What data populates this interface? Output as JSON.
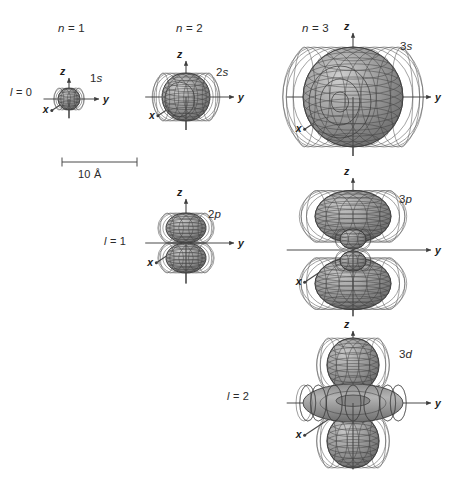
{
  "figure": {
    "background_color": "#ffffff",
    "surface_color": "#9a9a9a",
    "surface_color_dark": "#6f6f6f",
    "surface_color_light": "#c8c8c8",
    "mesh_color": "#3a3a3a",
    "axis_color": "#4a4a4a",
    "text_color": "#2b2b2b"
  },
  "column_headers": [
    {
      "id": "n1",
      "label": "n = 1",
      "italic_part": "n",
      "rest": " = 1",
      "x": 58,
      "y": 22
    },
    {
      "id": "n2",
      "label": "n = 2",
      "italic_part": "n",
      "rest": " = 2",
      "x": 176,
      "y": 22
    },
    {
      "id": "n3",
      "label": "n = 3",
      "italic_part": "n",
      "rest": " = 3",
      "x": 302,
      "y": 22
    }
  ],
  "row_labels": [
    {
      "id": "l0",
      "label": "l = 0",
      "italic_part": "l",
      "rest": " = 0",
      "x": 10,
      "y": 86
    },
    {
      "id": "l1",
      "label": "l = 1",
      "italic_part": "l",
      "rest": " = 1",
      "x": 104,
      "y": 235
    },
    {
      "id": "l2",
      "label": "l = 2",
      "italic_part": "l",
      "rest": " = 2",
      "x": 227,
      "y": 390
    }
  ],
  "orbitals": [
    {
      "id": "1s",
      "name": "1s",
      "n": 1,
      "l": 0,
      "shape": "sphere",
      "label_prefix": "1",
      "label_suffix": "s",
      "label_x": 90,
      "label_y": 72,
      "center_x": 69,
      "center_y": 99,
      "radius": 11,
      "axis_len_z": 21,
      "axis_len_y": 30,
      "axis_len_x": 22
    },
    {
      "id": "2s",
      "name": "2s",
      "n": 2,
      "l": 0,
      "shape": "sphere-nodal",
      "label_prefix": "2",
      "label_suffix": "s",
      "label_x": 216,
      "label_y": 66,
      "center_x": 186,
      "center_y": 97,
      "radius": 24,
      "axis_len_z": 36,
      "axis_len_y": 48,
      "axis_len_x": 36
    },
    {
      "id": "3s",
      "name": "3s",
      "n": 3,
      "l": 0,
      "shape": "sphere-nodal2",
      "label_prefix": "3",
      "label_suffix": "s",
      "label_x": 400,
      "label_y": 40,
      "center_x": 353,
      "center_y": 97,
      "radius": 50,
      "axis_len_z": 64,
      "axis_len_y": 78,
      "axis_len_x": 62
    },
    {
      "id": "2p",
      "name": "2p",
      "n": 2,
      "l": 1,
      "shape": "dumbbell",
      "label_prefix": "2",
      "label_suffix": "p",
      "label_x": 208,
      "label_y": 208,
      "center_x": 186,
      "center_y": 243,
      "lobe_rx": 20,
      "lobe_ry": 15,
      "lobe_offset": 15,
      "axis_len_z": 44,
      "axis_len_y": 48,
      "axis_len_x": 38
    },
    {
      "id": "3p",
      "name": "3p",
      "n": 3,
      "l": 1,
      "shape": "dumbbell-nodal",
      "label_prefix": "3",
      "label_suffix": "p",
      "label_x": 399,
      "label_y": 193,
      "center_x": 353,
      "center_y": 250,
      "lobe_rx": 38,
      "lobe_ry": 26,
      "lobe_offset": 32,
      "inner_rx": 13,
      "inner_ry": 10,
      "inner_offset": 11,
      "axis_len_z": 72,
      "axis_len_y": 78,
      "axis_len_x": 62
    },
    {
      "id": "3d",
      "name": "3d",
      "n": 3,
      "l": 2,
      "shape": "dz2",
      "label_prefix": "3",
      "label_suffix": "d",
      "label_x": 399,
      "label_y": 348,
      "center_x": 353,
      "center_y": 403,
      "lobe_rx": 26,
      "lobe_ry": 27,
      "lobe_offset": 38,
      "torus_rx": 50,
      "torus_ry": 19,
      "axis_len_z": 72,
      "axis_len_y": 78,
      "axis_len_x": 62
    }
  ],
  "axis_labels": {
    "z": "z",
    "y": "y",
    "x": "x"
  },
  "scale_bar": {
    "label": "10 Å",
    "x_start": 62,
    "x_end": 137,
    "y": 162,
    "tick_height": 9,
    "text_x": 78,
    "text_y": 168
  }
}
